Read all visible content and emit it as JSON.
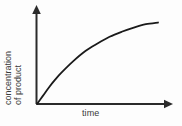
{
  "chart_data": {
    "type": "line",
    "title": "",
    "subtitle": "",
    "xlabel": "time",
    "ylabel": "concentration of product",
    "ylabel_line1": "concentration",
    "ylabel_line2": "of product",
    "grid": false,
    "legend": null,
    "axes": {
      "x_axis_arrow": true,
      "y_axis_arrow": true,
      "x_ticks": [],
      "y_ticks": [],
      "xlim": [
        0,
        1
      ],
      "ylim": [
        0,
        1
      ]
    },
    "annotations": [],
    "series": [
      {
        "name": "concentration of product",
        "description": "saturating curve rising steeply from origin then plateauing",
        "color": "#1a1a1a",
        "x": [
          0.0,
          0.05,
          0.1,
          0.15,
          0.2,
          0.3,
          0.4,
          0.5,
          0.6,
          0.7,
          0.8,
          0.9,
          1.0
        ],
        "y": [
          0.0,
          0.1,
          0.2,
          0.29,
          0.37,
          0.51,
          0.63,
          0.72,
          0.8,
          0.86,
          0.91,
          0.95,
          0.97
        ]
      }
    ]
  },
  "figure": {
    "background_color": "#fdfdfd",
    "line_color": "#1a1a1a",
    "axis_color": "#2b2b2b",
    "text_color": "#3a3a3a"
  }
}
